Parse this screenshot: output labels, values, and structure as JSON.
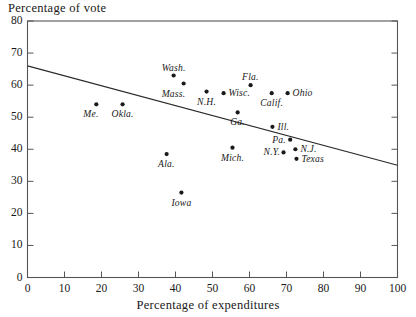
{
  "chart_data": {
    "type": "scatter",
    "title": "",
    "ylabel": "Percentage of vote",
    "xlabel": "Percentage of expenditures",
    "xlim": [
      0,
      100
    ],
    "ylim": [
      0,
      80
    ],
    "xticks": [
      0,
      10,
      20,
      30,
      40,
      50,
      60,
      70,
      80,
      90,
      100
    ],
    "yticks": [
      0,
      10,
      20,
      30,
      40,
      50,
      60,
      70,
      80
    ],
    "grid": false,
    "legend": "none",
    "marker_color": "#1a1a1a",
    "line_color": "#2a2a2a",
    "frame_color": "#555555",
    "trend_line": {
      "label": "regression line",
      "x": [
        0,
        100
      ],
      "y": [
        66,
        35
      ]
    },
    "points": [
      {
        "label": "Me.",
        "x": 18.6,
        "y": 54.0,
        "label_pos": "below-left"
      },
      {
        "label": "Okla.",
        "x": 25.7,
        "y": 54.0,
        "label_pos": "below"
      },
      {
        "label": "Wash.",
        "x": 39.5,
        "y": 63.0,
        "label_pos": "above"
      },
      {
        "label": "Mass.",
        "x": 42.2,
        "y": 60.5,
        "label_pos": "below-left"
      },
      {
        "label": "N.H.",
        "x": 48.4,
        "y": 58.0,
        "label_pos": "below"
      },
      {
        "label": "Wisc.",
        "x": 53.0,
        "y": 57.5,
        "label_pos": "right"
      },
      {
        "label": "Fla.",
        "x": 60.3,
        "y": 60.0,
        "label_pos": "above"
      },
      {
        "label": "Calif.",
        "x": 66.0,
        "y": 57.5,
        "label_pos": "below"
      },
      {
        "label": "Ohio",
        "x": 70.3,
        "y": 57.5,
        "label_pos": "right"
      },
      {
        "label": "Ga.",
        "x": 56.8,
        "y": 51.5,
        "label_pos": "below"
      },
      {
        "label": "Ill.",
        "x": 66.2,
        "y": 47.0,
        "label_pos": "right"
      },
      {
        "label": "Pa.",
        "x": 71.0,
        "y": 43.0,
        "label_pos": "left"
      },
      {
        "label": "N.J.",
        "x": 72.4,
        "y": 40.0,
        "label_pos": "right"
      },
      {
        "label": "N.Y.",
        "x": 69.2,
        "y": 39.0,
        "label_pos": "left"
      },
      {
        "label": "Texas",
        "x": 72.7,
        "y": 37.0,
        "label_pos": "right"
      },
      {
        "label": "Ala.",
        "x": 37.6,
        "y": 38.5,
        "label_pos": "below"
      },
      {
        "label": "Mich.",
        "x": 55.4,
        "y": 40.5,
        "label_pos": "below"
      },
      {
        "label": "Iowa",
        "x": 41.6,
        "y": 26.5,
        "label_pos": "below"
      }
    ]
  },
  "axes": {
    "y_title": "Percentage of vote",
    "x_title": "Percentage of expenditures"
  }
}
